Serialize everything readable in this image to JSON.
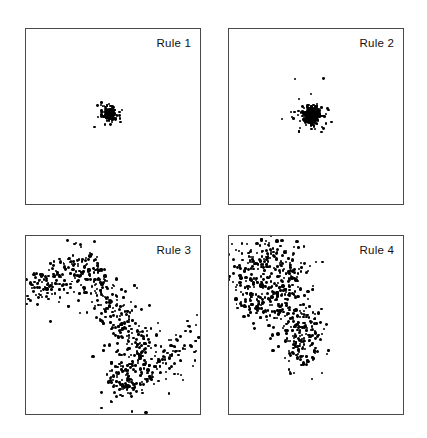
{
  "figure": {
    "width": 427,
    "height": 438,
    "background": "#ffffff",
    "border_color": "#4a4a4a",
    "point_color": "#000000",
    "layout": {
      "rows": 2,
      "cols": 2
    }
  },
  "chart_data": [
    {
      "type": "scatter",
      "title": "Rule 1",
      "xlabel": "",
      "ylabel": "",
      "xlim": [
        0,
        1
      ],
      "ylim": [
        0,
        1
      ],
      "grid": false,
      "legend": "none",
      "annotation": "Rule 1",
      "n_points": 500,
      "description": "Very tight dense cluster at the centre of the panel",
      "cluster": {
        "cx": 0.48,
        "cy": 0.485,
        "spread": 0.016,
        "seed": 11
      },
      "panel": {
        "x": 25,
        "y": 28,
        "w": 176,
        "h": 177
      }
    },
    {
      "type": "scatter",
      "title": "Rule 2",
      "xlabel": "",
      "ylabel": "",
      "xlim": [
        0,
        1
      ],
      "ylim": [
        0,
        1
      ],
      "grid": false,
      "legend": "none",
      "annotation": "Rule 2",
      "n_points": 500,
      "description": "Dense cluster at the centre, slightly broader with scattered outliers",
      "cluster": {
        "cx": 0.477,
        "cy": 0.495,
        "spread": 0.03,
        "seed": 23
      },
      "panel": {
        "x": 228,
        "y": 28,
        "w": 176,
        "h": 177
      }
    },
    {
      "type": "scatter",
      "title": "Rule 3",
      "xlabel": "",
      "ylabel": "",
      "xlim": [
        0,
        1
      ],
      "ylim": [
        0,
        1
      ],
      "grid": false,
      "legend": "none",
      "annotation": "Rule 3",
      "n_points": 620,
      "description": "Broad diagonal random-walk trail running from the upper-left edge through the centre down to the lower-right",
      "walk": {
        "spine": [
          [
            0.01,
            0.33
          ],
          [
            0.06,
            0.28
          ],
          [
            0.12,
            0.27
          ],
          [
            0.18,
            0.24
          ],
          [
            0.25,
            0.17
          ],
          [
            0.32,
            0.12
          ],
          [
            0.37,
            0.19
          ],
          [
            0.4,
            0.27
          ],
          [
            0.45,
            0.33
          ],
          [
            0.49,
            0.4
          ],
          [
            0.53,
            0.46
          ],
          [
            0.58,
            0.52
          ],
          [
            0.63,
            0.56
          ],
          [
            0.67,
            0.62
          ],
          [
            0.62,
            0.68
          ],
          [
            0.56,
            0.74
          ],
          [
            0.52,
            0.82
          ],
          [
            0.58,
            0.86
          ],
          [
            0.66,
            0.8
          ],
          [
            0.74,
            0.74
          ],
          [
            0.82,
            0.68
          ],
          [
            0.9,
            0.63
          ],
          [
            0.97,
            0.6
          ]
        ],
        "spread": 0.055,
        "seed": 37
      },
      "panel": {
        "x": 25,
        "y": 235,
        "w": 176,
        "h": 180
      }
    },
    {
      "type": "scatter",
      "title": "Rule 4",
      "xlabel": "",
      "ylabel": "",
      "xlim": [
        0,
        1
      ],
      "ylim": [
        0,
        1
      ],
      "grid": false,
      "legend": "none",
      "annotation": "Rule 4",
      "n_points": 560,
      "description": "Dense blob filling the upper-left quadrant with a narrow tail running down toward the centre",
      "walk": {
        "spine": [
          [
            0.06,
            0.22
          ],
          [
            0.12,
            0.14
          ],
          [
            0.2,
            0.1
          ],
          [
            0.28,
            0.13
          ],
          [
            0.34,
            0.18
          ],
          [
            0.38,
            0.25
          ],
          [
            0.33,
            0.3
          ],
          [
            0.26,
            0.27
          ],
          [
            0.18,
            0.24
          ],
          [
            0.12,
            0.3
          ],
          [
            0.1,
            0.38
          ],
          [
            0.17,
            0.42
          ],
          [
            0.25,
            0.4
          ],
          [
            0.32,
            0.43
          ],
          [
            0.39,
            0.46
          ],
          [
            0.45,
            0.52
          ],
          [
            0.42,
            0.58
          ],
          [
            0.4,
            0.65
          ],
          [
            0.44,
            0.7
          ],
          [
            0.4,
            0.62
          ]
        ],
        "spread": 0.06,
        "seed": 53
      },
      "panel": {
        "x": 228,
        "y": 235,
        "w": 176,
        "h": 180
      }
    }
  ]
}
